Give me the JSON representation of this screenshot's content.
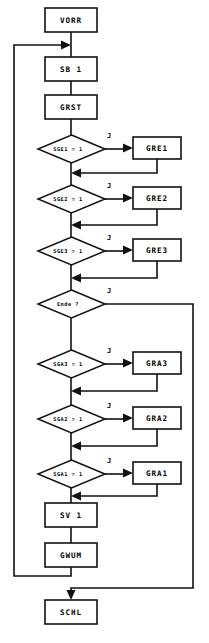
{
  "diagram": {
    "type": "flowchart",
    "branch_label_yes": "J",
    "colors": {
      "stroke": "#111111",
      "fill": "#ffffff",
      "text": "#000000"
    },
    "nodes": [
      {
        "id": "vorr",
        "label": "VORR",
        "shape": "process",
        "x": 45,
        "y": 8,
        "w": 52,
        "h": 24
      },
      {
        "id": "sb1",
        "label": "SB 1",
        "shape": "process",
        "x": 45,
        "y": 57,
        "w": 52,
        "h": 24
      },
      {
        "id": "grst",
        "label": "GRST",
        "shape": "process",
        "x": 45,
        "y": 95,
        "w": 52,
        "h": 24
      },
      {
        "id": "sge1",
        "label": "SGE1 = 1",
        "shape": "decision",
        "x": 38,
        "y": 135,
        "w": 67,
        "h": 28
      },
      {
        "id": "gre1",
        "label": "GRE1",
        "shape": "process",
        "x": 133,
        "y": 137,
        "w": 48,
        "h": 22
      },
      {
        "id": "sge2",
        "label": "SGE2 = 1",
        "shape": "decision",
        "x": 38,
        "y": 185,
        "w": 67,
        "h": 28
      },
      {
        "id": "gre2",
        "label": "GRE2",
        "shape": "process",
        "x": 133,
        "y": 187,
        "w": 48,
        "h": 22
      },
      {
        "id": "sge3",
        "label": "SGE3 = 1",
        "shape": "decision",
        "x": 38,
        "y": 237,
        "w": 67,
        "h": 28
      },
      {
        "id": "gre3",
        "label": "GRE3",
        "shape": "process",
        "x": 133,
        "y": 239,
        "w": 48,
        "h": 22
      },
      {
        "id": "ende",
        "label": "Ende ?",
        "shape": "decision",
        "x": 38,
        "y": 290,
        "w": 67,
        "h": 28
      },
      {
        "id": "sga3",
        "label": "SGA3 = 1",
        "shape": "decision",
        "x": 38,
        "y": 350,
        "w": 67,
        "h": 28
      },
      {
        "id": "gra3",
        "label": "GRA3",
        "shape": "process",
        "x": 133,
        "y": 352,
        "w": 48,
        "h": 22
      },
      {
        "id": "sga2",
        "label": "SGA2 = 1",
        "shape": "decision",
        "x": 38,
        "y": 405,
        "w": 67,
        "h": 28
      },
      {
        "id": "gra2",
        "label": "GRA2",
        "shape": "process",
        "x": 133,
        "y": 407,
        "w": 48,
        "h": 22
      },
      {
        "id": "sga1",
        "label": "SGA1 = 1",
        "shape": "decision",
        "x": 38,
        "y": 460,
        "w": 67,
        "h": 28
      },
      {
        "id": "gra1",
        "label": "GRA1",
        "shape": "process",
        "x": 133,
        "y": 462,
        "w": 48,
        "h": 22
      },
      {
        "id": "sv1",
        "label": "SV 1",
        "shape": "process",
        "x": 45,
        "y": 503,
        "w": 52,
        "h": 24
      },
      {
        "id": "gwum",
        "label": "GWUM",
        "shape": "process",
        "x": 45,
        "y": 543,
        "w": 52,
        "h": 24
      },
      {
        "id": "schl",
        "label": "SCHL",
        "shape": "process",
        "x": 45,
        "y": 600,
        "w": 52,
        "h": 24
      }
    ],
    "branch_labels": [
      {
        "for": "sge1",
        "text": "J",
        "x": 104,
        "y": 133
      },
      {
        "for": "sge2",
        "text": "J",
        "x": 104,
        "y": 183
      },
      {
        "for": "sge3",
        "text": "J",
        "x": 104,
        "y": 235
      },
      {
        "for": "ende",
        "text": "J",
        "x": 104,
        "y": 288
      },
      {
        "for": "sga3",
        "text": "J",
        "x": 104,
        "y": 348
      },
      {
        "for": "sga2",
        "text": "J",
        "x": 104,
        "y": 403
      },
      {
        "for": "sga1",
        "text": "J",
        "x": 104,
        "y": 458
      }
    ],
    "edges": [
      {
        "from": "vorr",
        "to": "sb1",
        "kind": "straight-down"
      },
      {
        "from": "sb1",
        "to": "grst",
        "kind": "straight-down"
      },
      {
        "from": "grst",
        "to": "sge1",
        "kind": "straight-down"
      },
      {
        "from": "sge1",
        "to": "gre1",
        "kind": "yes-right"
      },
      {
        "from": "gre1",
        "to": "sge2",
        "kind": "return-left"
      },
      {
        "from": "sge2",
        "to": "gre2",
        "kind": "yes-right"
      },
      {
        "from": "gre2",
        "to": "sge3",
        "kind": "return-left"
      },
      {
        "from": "sge3",
        "to": "gre3",
        "kind": "yes-right"
      },
      {
        "from": "gre3",
        "to": "ende",
        "kind": "return-left"
      },
      {
        "from": "ende",
        "to": "schl",
        "kind": "yes-right-down-far"
      },
      {
        "from": "ende",
        "to": "sga3",
        "kind": "straight-down"
      },
      {
        "from": "sga3",
        "to": "gra3",
        "kind": "yes-right"
      },
      {
        "from": "gra3",
        "to": "sga2",
        "kind": "return-left"
      },
      {
        "from": "sga2",
        "to": "gra2",
        "kind": "yes-right"
      },
      {
        "from": "gra2",
        "to": "sga1",
        "kind": "return-left"
      },
      {
        "from": "sga1",
        "to": "gra1",
        "kind": "yes-right"
      },
      {
        "from": "gra1",
        "to": "sv1",
        "kind": "return-left"
      },
      {
        "from": "sv1",
        "to": "gwum",
        "kind": "straight-down"
      },
      {
        "from": "gwum",
        "to": "vorr",
        "kind": "loop-back-left"
      }
    ]
  }
}
